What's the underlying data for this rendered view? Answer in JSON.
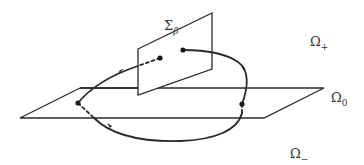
{
  "diagram": {
    "labels": {
      "sigma_beta": {
        "main": "Σ",
        "sub": "β"
      },
      "omega_plus": {
        "main": "Ω",
        "sub": "+"
      },
      "omega_zero": {
        "main": "Ω",
        "sub": "0"
      },
      "omega_minus": {
        "main": "Ω",
        "sub": "−"
      }
    },
    "colors": {
      "stroke": "#2a2a2a",
      "text": "#333333",
      "background": "#ffffff"
    }
  }
}
